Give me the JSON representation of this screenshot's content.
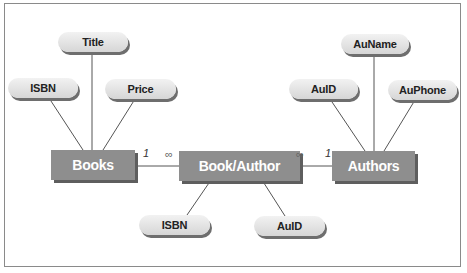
{
  "diagram": {
    "type": "entity-relationship",
    "entities": [
      {
        "id": "books",
        "label": "Books"
      },
      {
        "id": "book_author",
        "label": "Book/Author"
      },
      {
        "id": "authors",
        "label": "Authors"
      }
    ],
    "attributes": {
      "books": [
        {
          "label": "ISBN"
        },
        {
          "label": "Title"
        },
        {
          "label": "Price"
        }
      ],
      "book_author": [
        {
          "label": "ISBN"
        },
        {
          "label": "AuID"
        }
      ],
      "authors": [
        {
          "label": "AuID"
        },
        {
          "label": "AuName"
        },
        {
          "label": "AuPhone"
        }
      ]
    },
    "relationships": [
      {
        "from": "Books",
        "to": "Book/Author",
        "from_cardinality": "1",
        "to_cardinality": "∞"
      },
      {
        "from": "Authors",
        "to": "Book/Author",
        "from_cardinality": "1",
        "to_cardinality": "∞"
      }
    ]
  }
}
